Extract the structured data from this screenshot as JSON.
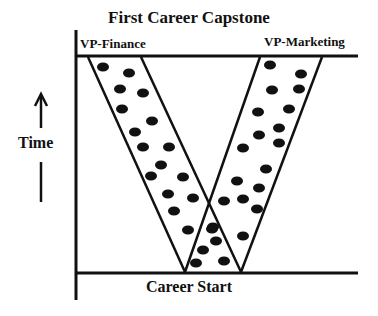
{
  "diagram": {
    "title": "First Career Capstone",
    "top_left_label": "VP-Finance",
    "top_right_label": "VP-Marketing",
    "bottom_label": "Career Start",
    "axis_label": "Time",
    "axis_direction": "up",
    "colors": {
      "line": "#111111",
      "dot": "#111111",
      "background": "#ffffff"
    },
    "bands": [
      {
        "name": "finance-path",
        "top": [
          88,
          141
        ],
        "bottom": [
          185,
          241
        ]
      },
      {
        "name": "marketing-path",
        "top": [
          260,
          322
        ],
        "bottom": [
          185,
          241
        ]
      }
    ],
    "dots": [
      [
        103,
        67
      ],
      [
        129,
        73
      ],
      [
        120,
        89
      ],
      [
        143,
        93
      ],
      [
        122,
        109
      ],
      [
        152,
        121
      ],
      [
        135,
        132
      ],
      [
        143,
        147
      ],
      [
        169,
        147
      ],
      [
        161,
        165
      ],
      [
        151,
        176
      ],
      [
        183,
        177
      ],
      [
        168,
        194
      ],
      [
        193,
        198
      ],
      [
        174,
        211
      ],
      [
        188,
        230
      ],
      [
        270,
        65
      ],
      [
        301,
        74
      ],
      [
        272,
        90
      ],
      [
        299,
        89
      ],
      [
        258,
        112
      ],
      [
        289,
        109
      ],
      [
        279,
        128
      ],
      [
        259,
        135
      ],
      [
        279,
        143
      ],
      [
        243,
        148
      ],
      [
        266,
        169
      ],
      [
        237,
        181
      ],
      [
        259,
        188
      ],
      [
        224,
        201
      ],
      [
        243,
        199
      ],
      [
        257,
        209
      ],
      [
        212,
        229
      ],
      [
        243,
        236
      ],
      [
        213,
        227
      ],
      [
        216,
        241
      ],
      [
        203,
        250
      ],
      [
        196,
        263
      ],
      [
        224,
        261
      ]
    ]
  }
}
